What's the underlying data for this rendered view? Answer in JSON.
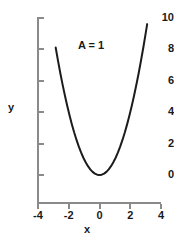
{
  "chart_data": {
    "type": "line",
    "title": "",
    "subtitle": "",
    "xlabel": "x",
    "ylabel": "y",
    "xlim": [
      -4,
      4
    ],
    "ylim": [
      0,
      10
    ],
    "grid": false,
    "legend": null,
    "annotations": [
      {
        "text": "A = 1",
        "x": 0.6,
        "y": 8.0
      }
    ],
    "xticks": [
      -4,
      -2,
      0,
      2,
      4
    ],
    "xticklabels": [
      "-4",
      "-2",
      "0",
      "2",
      "4"
    ],
    "yticks": [
      0,
      2,
      4,
      6,
      8,
      10
    ],
    "yticklabels": [
      "0",
      "2",
      "4",
      "6",
      "8",
      "10"
    ],
    "series": [
      {
        "name": "y = A x^2",
        "equation": "y = 1 * x^2",
        "color": "#1c1c1c",
        "linewidth": 2,
        "x": [
          -2.85,
          -2.7,
          -2.55,
          -2.4,
          -2.25,
          -2.1,
          -1.95,
          -1.8,
          -1.65,
          -1.5,
          -1.35,
          -1.2,
          -1.05,
          -0.9,
          -0.75,
          -0.6,
          -0.45,
          -0.3,
          -0.15,
          0,
          0.15,
          0.3,
          0.45,
          0.6,
          0.75,
          0.9,
          1.05,
          1.2,
          1.35,
          1.5,
          1.65,
          1.8,
          1.95,
          2.1,
          2.25,
          2.4,
          2.55,
          2.7,
          2.85,
          3.0,
          3.1
        ],
        "values": [
          8.12,
          7.29,
          6.5,
          5.76,
          5.06,
          4.41,
          3.8,
          3.24,
          2.72,
          2.25,
          1.82,
          1.44,
          1.1,
          0.81,
          0.56,
          0.36,
          0.2,
          0.09,
          0.02,
          0,
          0.02,
          0.09,
          0.2,
          0.36,
          0.56,
          0.81,
          1.1,
          1.44,
          1.82,
          2.25,
          2.72,
          3.24,
          3.8,
          4.41,
          5.06,
          5.76,
          6.5,
          7.29,
          8.12,
          9.0,
          9.61
        ]
      }
    ]
  },
  "axes": {
    "y_title": "y",
    "x_title": "x",
    "annotation_text": "A = 1",
    "axis_color": "#8a8a8a",
    "tick_color": "#8a8a8a",
    "label_color": "#1a1a1a",
    "curve_color": "#1c1c1c",
    "background_color": "#ffffff"
  }
}
